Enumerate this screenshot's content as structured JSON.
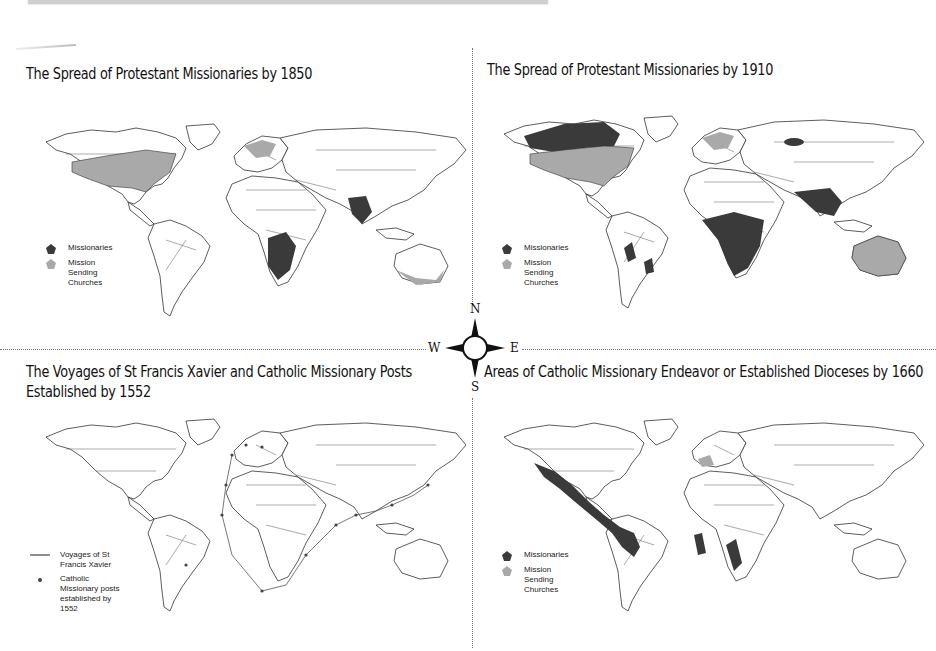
{
  "colors": {
    "missionaries": "#3a3a3a",
    "sending_churches": "#a9a9a9",
    "land": "#ffffff",
    "border": "#333333"
  },
  "panels": [
    {
      "id": "protestant-1850",
      "title": "The Spread of Protestant Missionaries by 1850",
      "legend": [
        {
          "icon": "pentagon-dark",
          "label": "Missionaries"
        },
        {
          "icon": "pentagon-light",
          "label": "Mission Sending Churches"
        }
      ]
    },
    {
      "id": "protestant-1910",
      "title": "The Spread of Protestant Missionaries by 1910",
      "legend": [
        {
          "icon": "pentagon-dark",
          "label": "Missionaries"
        },
        {
          "icon": "pentagon-light",
          "label": "Mission Sending Churches"
        }
      ]
    },
    {
      "id": "xavier-1552",
      "title_line1": "The Voyages of St Francis Xavier and Catholic Missionary Posts",
      "title_line2": "Established by 1552",
      "legend": [
        {
          "icon": "line",
          "label": "Voyages of St Francis Xavier"
        },
        {
          "icon": "dot",
          "label": "Catholic Missionary posts established by 1552"
        }
      ]
    },
    {
      "id": "catholic-1660",
      "title": "Areas of Catholic Missionary Endeavor or Established Dioceses by 1660",
      "legend": [
        {
          "icon": "pentagon-dark",
          "label": "Missionaries"
        },
        {
          "icon": "pentagon-light",
          "label": "Mission Sending Churches"
        }
      ]
    }
  ],
  "compass": {
    "n": "N",
    "s": "S",
    "e": "E",
    "w": "W"
  }
}
